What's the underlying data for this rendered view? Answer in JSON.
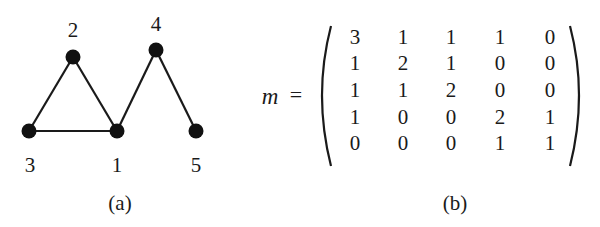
{
  "figure": {
    "panel_a": {
      "caption": "(a)",
      "nodes": [
        {
          "id": "1",
          "label": "1",
          "x": 117,
          "y": 131,
          "label_x": 117,
          "label_y": 165
        },
        {
          "id": "2",
          "label": "2",
          "x": 73,
          "y": 57,
          "label_x": 73,
          "label_y": 30
        },
        {
          "id": "3",
          "label": "3",
          "x": 29,
          "y": 131,
          "label_x": 30,
          "label_y": 165
        },
        {
          "id": "4",
          "label": "4",
          "x": 156,
          "y": 50,
          "label_x": 156,
          "label_y": 24
        },
        {
          "id": "5",
          "label": "5",
          "x": 196,
          "y": 131,
          "label_x": 196,
          "label_y": 165
        }
      ],
      "edges": [
        [
          "3",
          "2"
        ],
        [
          "2",
          "1"
        ],
        [
          "3",
          "1"
        ],
        [
          "1",
          "4"
        ],
        [
          "4",
          "5"
        ]
      ]
    },
    "panel_b": {
      "caption": "(b)",
      "variable": "m",
      "equals": "=",
      "matrix": [
        [
          "3",
          "1",
          "1",
          "1",
          "0"
        ],
        [
          "1",
          "2",
          "1",
          "0",
          "0"
        ],
        [
          "1",
          "1",
          "2",
          "0",
          "0"
        ],
        [
          "1",
          "0",
          "0",
          "2",
          "1"
        ],
        [
          "0",
          "0",
          "0",
          "1",
          "1"
        ]
      ]
    }
  }
}
